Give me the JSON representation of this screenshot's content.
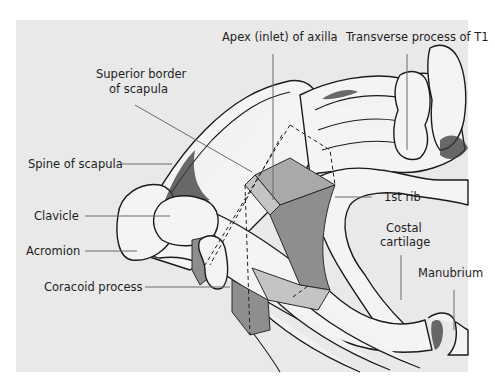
{
  "figure": {
    "background_color": "#e9e9e9",
    "bone_color": "#f4f4f4",
    "prism_colors": [
      "#a9a9a9",
      "#8e8e8e",
      "#c4c4c4"
    ],
    "labels": {
      "apex": "Apex (inlet) of axilla",
      "transverse_process": "Transverse process of T1",
      "superior_border_line1": "Superior border",
      "superior_border_line2": "of scapula",
      "spine_of_scapula": "Spine of scapula",
      "first_rib": "1st rib",
      "clavicle": "Clavicle",
      "costal_cartilage_line1": "Costal",
      "costal_cartilage_line2": "cartilage",
      "acromion": "Acromion",
      "manubrium": "Manubrium",
      "coracoid_process": "Coracoid process"
    }
  }
}
